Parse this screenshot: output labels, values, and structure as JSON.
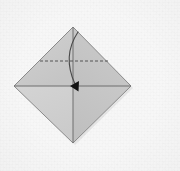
{
  "figure": {
    "caption": "Square sheet rotated to diamond orientation with valley fold lines and a fold-down arrow",
    "background_color": "#f7f7f7",
    "canvas": {
      "width": 180,
      "height": 171
    }
  },
  "sheet": {
    "name": "paper-square",
    "orientation": "diamond",
    "outline_color": "#8a8a8a",
    "outline_width": 1,
    "vertices": {
      "top": {
        "x": 73,
        "y": 27
      },
      "right": {
        "x": 131,
        "y": 86
      },
      "bottom": {
        "x": 73,
        "y": 143
      },
      "left": {
        "x": 14,
        "y": 86
      }
    },
    "center": {
      "x": 73,
      "y": 86
    },
    "quadrant_fills": {
      "top_left": "#c9c9c9",
      "top_right": "#c6c6c6",
      "bottom_left": "#cfcfcf",
      "bottom_right": "#c4c4c4"
    }
  },
  "creases": [
    {
      "name": "horizontal-diagonal-crease",
      "style": "solid",
      "color": "#6e6e6e",
      "from": {
        "x": 14,
        "y": 86
      },
      "to": {
        "x": 131,
        "y": 86
      }
    },
    {
      "name": "vertical-diagonal-crease",
      "style": "solid",
      "color": "#6e6e6e",
      "from": {
        "x": 73,
        "y": 27
      },
      "to": {
        "x": 73,
        "y": 143
      }
    },
    {
      "name": "horizontal-valley-fold-line",
      "style": "dashed",
      "color": "#555555",
      "dash_pattern": "3 2",
      "from": {
        "x": 40,
        "y": 61
      },
      "to": {
        "x": 108,
        "y": 61
      }
    }
  ],
  "arrow": {
    "name": "fold-down-arrow",
    "type": "curved",
    "color": "#4a4a4a",
    "start": {
      "x": 78,
      "y": 32
    },
    "control": {
      "x": 62,
      "y": 56
    },
    "end": {
      "x": 75,
      "y": 84
    },
    "head": {
      "shape": "filled-triangle",
      "fill": "#121212",
      "tip": {
        "x": 70,
        "y": 86
      },
      "size": 7
    }
  },
  "legend": {
    "dashed_meaning": "valley fold",
    "solid_meaning": "existing crease",
    "arrow_meaning": "fold top point down to center"
  }
}
